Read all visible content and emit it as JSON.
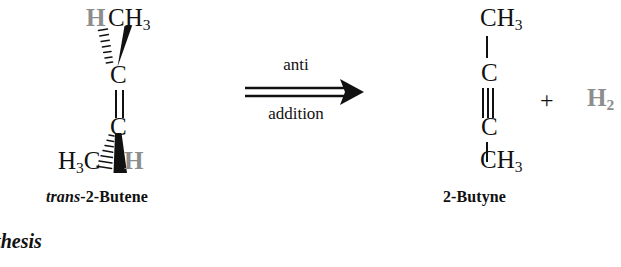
{
  "figure": {
    "type": "chemical-reaction-scheme",
    "background_color": "#ffffff",
    "text_color": "#111111",
    "gray_color": "#8d8d8d"
  },
  "reactant": {
    "name_prefix": "trans",
    "name_rest": "-2-Butene",
    "top_left_label": "H",
    "top_right_label": "CH",
    "top_right_sub": "3",
    "carbon_upper": "C",
    "carbon_lower": "C",
    "bottom_left_label": "H",
    "bottom_left_sub": "3",
    "bottom_left_label2": "C",
    "bottom_right_label": "H",
    "bond_type": "double",
    "stereo_bonds": [
      {
        "position": "top-left",
        "style": "hashed-wedge",
        "to": "H"
      },
      {
        "position": "top-right",
        "style": "solid-wedge",
        "to": "CH3"
      },
      {
        "position": "bottom-left",
        "style": "hashed-wedge",
        "to": "H3C"
      },
      {
        "position": "bottom-right",
        "style": "solid-wedge",
        "to": "H"
      }
    ]
  },
  "arrow": {
    "label_above": "anti",
    "label_below": "addition",
    "style": "double-line-right-arrow",
    "direction": "right"
  },
  "product": {
    "name": "2-Butyne",
    "top_label": "CH",
    "top_sub": "3",
    "carbon_upper": "C",
    "carbon_lower": "C",
    "bottom_label": "CH",
    "bottom_sub": "3",
    "bond_type": "triple"
  },
  "byproduct": {
    "plus": "+",
    "label": "H",
    "sub": "2"
  },
  "caption": {
    "fragment": "nthesis"
  }
}
